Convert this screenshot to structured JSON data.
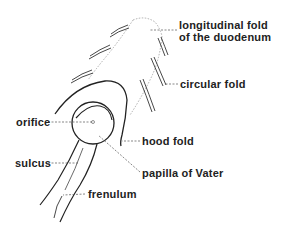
{
  "diagram": {
    "labels": [
      {
        "id": "longitudinal-fold",
        "line1": "longitudinal fold",
        "line2": "of the duodenum"
      },
      {
        "id": "circular-fold",
        "text": "circular fold"
      },
      {
        "id": "orifice",
        "text": "orifice"
      },
      {
        "id": "hood-fold",
        "text": "hood fold"
      },
      {
        "id": "sulcus",
        "text": "sulcus"
      },
      {
        "id": "papilla-of-vater",
        "text": "papilla of Vater"
      },
      {
        "id": "frenulum",
        "text": "frenulum"
      }
    ],
    "colors": {
      "stroke": "#222222",
      "dotted": "#999999",
      "text": "#222222",
      "background": "#ffffff"
    }
  }
}
